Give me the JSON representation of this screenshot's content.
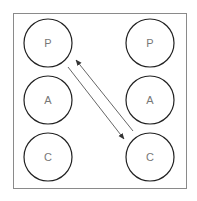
{
  "diagram": {
    "left_column": [
      {
        "label": "P"
      },
      {
        "label": "A"
      },
      {
        "label": "C"
      }
    ],
    "right_column": [
      {
        "label": "P"
      },
      {
        "label": "A"
      },
      {
        "label": "C"
      }
    ],
    "edges": [
      {
        "from": "left.P",
        "to": "right.C",
        "direction": "down-right"
      },
      {
        "from": "right.C",
        "to": "left.P",
        "direction": "up-left"
      }
    ],
    "colors": {
      "frame": "#8a8a8a",
      "node_stroke": "#222222",
      "label": "#777777",
      "arrow": "#555555"
    }
  }
}
